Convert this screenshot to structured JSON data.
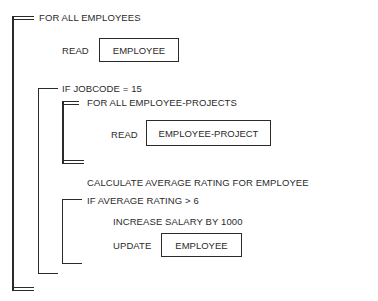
{
  "diagram": {
    "type": "structured program flow (nested iteration/selection brackets)",
    "outer_loop": {
      "label": "FOR ALL EMPLOYEES",
      "read_keyword": "READ",
      "read_entity": "EMPLOYEE"
    },
    "if_jobcode": {
      "label": "IF JOBCODE = 15",
      "inner_loop": {
        "label": "FOR ALL EMPLOYEE-PROJECTS",
        "read_keyword": "READ",
        "read_entity": "EMPLOYEE-PROJECT"
      },
      "calculate": "CALCULATE AVERAGE RATING FOR EMPLOYEE",
      "if_rating": {
        "label": "IF AVERAGE RATING > 6",
        "increase": "INCREASE SALARY BY 1000",
        "update_keyword": "UPDATE",
        "update_entity": "EMPLOYEE"
      }
    }
  }
}
